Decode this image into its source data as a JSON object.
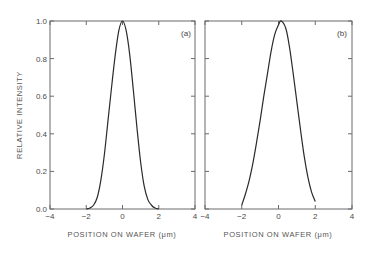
{
  "chart_data": [
    {
      "type": "line",
      "panel_label": "(a)",
      "xlabel": "POSITION ON WAFER (μm)",
      "ylabel": "RELATIVE INTENSITY",
      "xlim": [
        -4,
        4
      ],
      "ylim": [
        0.0,
        1.0
      ],
      "x_ticks": [
        "-4",
        "-2",
        "0",
        "2",
        "4"
      ],
      "y_ticks": [
        "0.0",
        "0.2",
        "0.4",
        "0.6",
        "0.8",
        "1.0"
      ],
      "grid": false,
      "series": [
        {
          "name": "profile (a)",
          "x": [
            -2.0,
            -1.8,
            -1.6,
            -1.4,
            -1.2,
            -1.0,
            -0.8,
            -0.6,
            -0.4,
            -0.2,
            0.0,
            0.2,
            0.4,
            0.6,
            0.8,
            1.0,
            1.2,
            1.4,
            1.6,
            1.8,
            2.0
          ],
          "y": [
            0.0,
            0.005,
            0.02,
            0.06,
            0.15,
            0.29,
            0.47,
            0.65,
            0.82,
            0.95,
            1.0,
            0.95,
            0.82,
            0.63,
            0.43,
            0.25,
            0.12,
            0.05,
            0.02,
            0.005,
            0.0
          ]
        }
      ]
    },
    {
      "type": "line",
      "panel_label": "(b)",
      "xlabel": "POSITION ON WAFER (μm)",
      "ylabel": "",
      "xlim": [
        -4,
        4
      ],
      "ylim": [
        0.0,
        1.0
      ],
      "x_ticks": [
        "-4",
        "-2",
        "0",
        "2",
        "4"
      ],
      "y_ticks": [],
      "grid": false,
      "series": [
        {
          "name": "profile (b)",
          "x": [
            -2.0,
            -1.8,
            -1.6,
            -1.4,
            -1.2,
            -1.0,
            -0.8,
            -0.6,
            -0.4,
            -0.2,
            0.0,
            0.15,
            0.4,
            0.6,
            0.8,
            1.0,
            1.2,
            1.4,
            1.6,
            1.8,
            2.0
          ],
          "y": [
            0.02,
            0.08,
            0.15,
            0.24,
            0.35,
            0.47,
            0.6,
            0.72,
            0.84,
            0.93,
            0.98,
            1.0,
            0.96,
            0.86,
            0.72,
            0.57,
            0.42,
            0.28,
            0.17,
            0.09,
            0.04
          ]
        }
      ]
    }
  ],
  "labels": {
    "panel_a": "(a)",
    "panel_b": "(b)",
    "ylabel": "RELATIVE INTENSITY",
    "xlabel": "POSITION ON WAFER (μm)"
  }
}
